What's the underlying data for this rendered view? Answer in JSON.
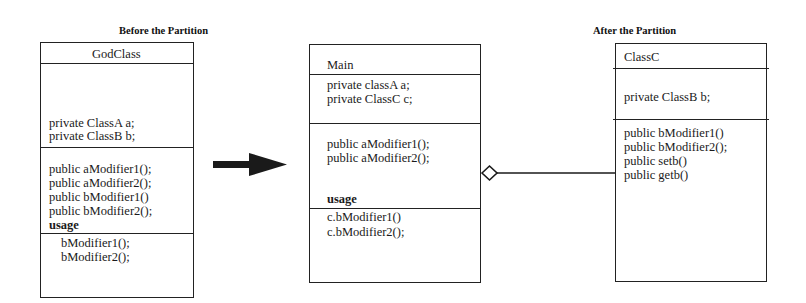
{
  "captions": {
    "before": "Before the Partition",
    "after": "After the Partition"
  },
  "godclass": {
    "name": "GodClass",
    "attributes": [
      "private ClassA  a;",
      "private ClassB  b;"
    ],
    "methods": [
      "public aModifier1();",
      "public aModifier2();",
      "public bModifier1()",
      "public bModifier2();",
      "usage"
    ],
    "usage": [
      "bModifier1();",
      "bModifier2();"
    ]
  },
  "main": {
    "name": "Main",
    "attributes": [
      "private classA a;",
      "private ClassC c;"
    ],
    "methods": [
      "public aModifier1();",
      "public aModifier2();"
    ],
    "usage_label": "usage",
    "usage": [
      "c.bModifier1()",
      "c.bModifier2();"
    ]
  },
  "classc": {
    "name": "ClassC",
    "attributes": [
      "private ClassB b;"
    ],
    "methods": [
      "public bModifier1()",
      "public bModifier2();",
      "public setb()",
      "public getb()"
    ]
  },
  "connectors": {
    "transform_arrow": "right-arrow",
    "aggregation": "hollow-diamond-aggregation"
  }
}
